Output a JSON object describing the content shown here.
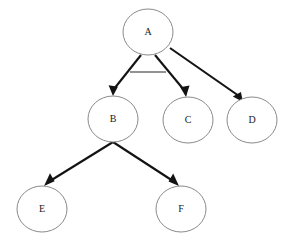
{
  "diagram": {
    "type": "directed-tree",
    "canvas": {
      "width": 302,
      "height": 243,
      "background": "#ffffff"
    },
    "style": {
      "node_fill": "#ffffff",
      "node_stroke": "#8a8a8a",
      "edge_color": "#131313",
      "crossbar_color": "#6e6e6e",
      "label_color": "#1a1a1a"
    },
    "nodes": [
      {
        "id": "A",
        "label": "A",
        "cx": 148,
        "cy": 32,
        "rx": 25,
        "ry": 23
      },
      {
        "id": "B",
        "label": "B",
        "cx": 113,
        "cy": 119,
        "rx": 25,
        "ry": 23
      },
      {
        "id": "C",
        "label": "C",
        "cx": 188,
        "cy": 120,
        "rx": 25,
        "ry": 23
      },
      {
        "id": "D",
        "label": "D",
        "cx": 252,
        "cy": 120,
        "rx": 25,
        "ry": 23
      },
      {
        "id": "E",
        "label": "E",
        "cx": 42,
        "cy": 209,
        "rx": 25,
        "ry": 23
      },
      {
        "id": "F",
        "label": "F",
        "cx": 181,
        "cy": 209,
        "rx": 25,
        "ry": 23
      }
    ],
    "edges": [
      {
        "id": "A-B",
        "from": "A",
        "to": "B",
        "x1": 141,
        "y1": 55,
        "x2": 113,
        "y2": 95
      },
      {
        "id": "A-C",
        "from": "A",
        "to": "C",
        "x1": 155,
        "y1": 55,
        "x2": 185,
        "y2": 96
      },
      {
        "id": "A-D",
        "from": "A",
        "to": "D",
        "x1": 170,
        "y1": 48,
        "x2": 241,
        "y2": 101
      },
      {
        "id": "B-E",
        "from": "B",
        "to": "E",
        "x1": 113,
        "y1": 142,
        "x2": 47,
        "y2": 186
      },
      {
        "id": "B-F",
        "from": "B",
        "to": "F",
        "x1": 113,
        "y1": 142,
        "x2": 176,
        "y2": 186
      }
    ],
    "crossbar": {
      "id": "crossbar-A",
      "x1": 130,
      "y1": 72,
      "x2": 166,
      "y2": 72
    }
  }
}
